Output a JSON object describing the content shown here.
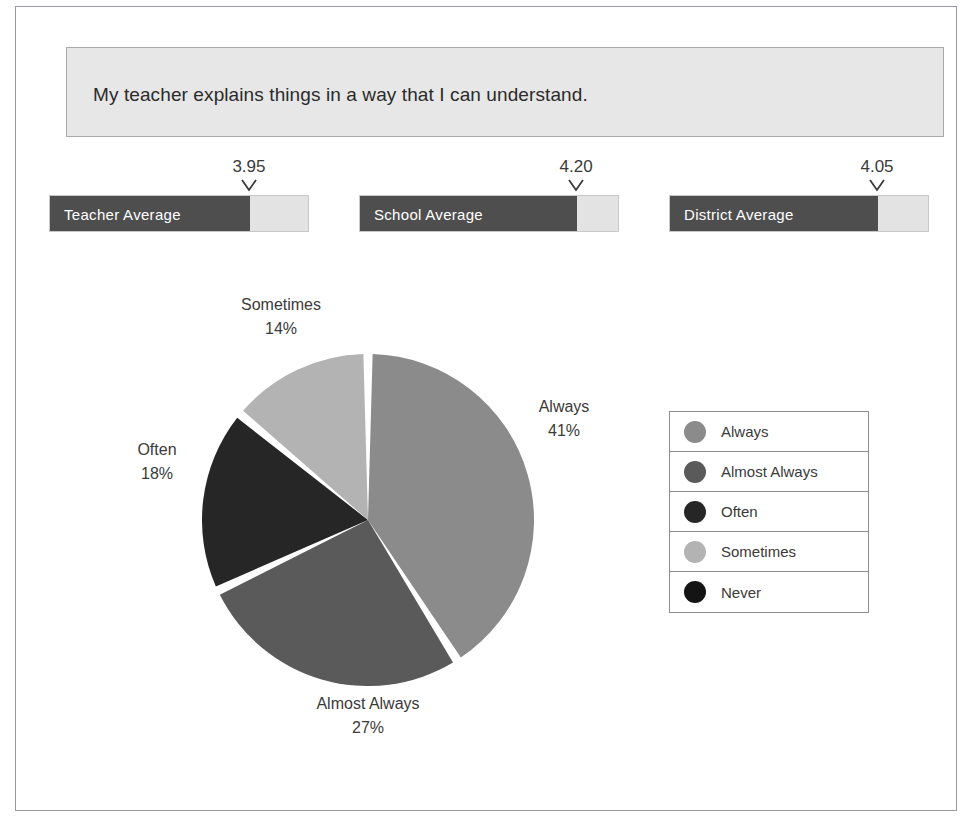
{
  "question": {
    "text": "My teacher explains things in a way that I can understand."
  },
  "averages": [
    {
      "label": "Teacher Average",
      "value": "3.95",
      "value_num": 3.95,
      "fill_pct": 76.9
    },
    {
      "label": "School Average",
      "value": "4.20",
      "value_num": 4.2,
      "fill_pct": 83.5
    },
    {
      "label": "District Average",
      "value": "4.05",
      "value_num": 4.05,
      "fill_pct": 80.0
    }
  ],
  "legend": {
    "items": [
      {
        "label": "Always",
        "color": "#8b8b8b"
      },
      {
        "label": "Almost Always",
        "color": "#5a5a5a"
      },
      {
        "label": "Often",
        "color": "#262626"
      },
      {
        "label": "Sometimes",
        "color": "#b3b3b3"
      },
      {
        "label": "Never",
        "color": "#141414"
      }
    ]
  },
  "pie_labels": {
    "always": {
      "name": "Always",
      "pct": "41%"
    },
    "almost_always": {
      "name": "Almost Always",
      "pct": "27%"
    },
    "often": {
      "name": "Often",
      "pct": "18%"
    },
    "sometimes": {
      "name": "Sometimes",
      "pct": "14%"
    }
  },
  "chart_data": {
    "type": "pie",
    "title": "My teacher explains things in a way that I can understand.",
    "categories": [
      "Always",
      "Almost Always",
      "Often",
      "Sometimes",
      "Never"
    ],
    "values": [
      41,
      27,
      18,
      14,
      0
    ],
    "value_labels": [
      "41%",
      "27%",
      "18%",
      "14%",
      ""
    ],
    "colors": [
      "#8b8b8b",
      "#5a5a5a",
      "#262626",
      "#b3b3b3",
      "#141414"
    ],
    "units": "percent",
    "start_angle_deg": 0,
    "direction": "clockwise",
    "legend_position": "right",
    "grid": false,
    "slice_gap": true,
    "companion_bars": {
      "type": "bar",
      "orientation": "horizontal",
      "categories": [
        "Teacher Average",
        "School Average",
        "District Average"
      ],
      "values": [
        3.95,
        4.2,
        4.05
      ],
      "xlim": [
        0,
        5
      ],
      "ylabel": "",
      "xlabel": ""
    }
  }
}
